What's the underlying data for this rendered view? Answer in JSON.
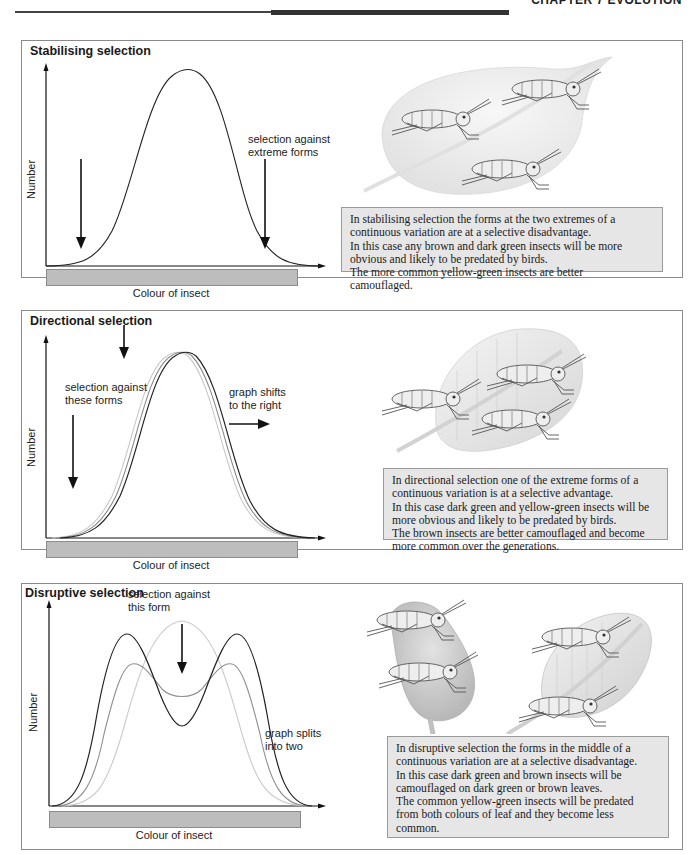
{
  "header": {
    "chapter_label": "CHAPTER 7  EVOLUTION"
  },
  "panels": [
    {
      "title": "Stabilising selection",
      "y_axis_label": "Number",
      "x_axis_label": "Colour of insect",
      "annotations": [
        "selection against",
        "extreme forms"
      ],
      "caption": [
        "In stabilising selection the forms at the two extremes of a",
        "continuous variation are at a selective disadvantage.",
        "In this case any brown and dark green insects will be more",
        "obvious and likely to be predated by birds.",
        "The more common yellow-green insects are better",
        "camouflaged."
      ]
    },
    {
      "title": "Directional selection",
      "y_axis_label": "Number",
      "x_axis_label": "Colour of insect",
      "annotations": [
        "selection against",
        "these forms"
      ],
      "annotations_right": [
        "graph shifts",
        "to the right"
      ],
      "caption": [
        "In directional selection one of the extreme forms of a",
        "continuous variation is at a selective advantage.",
        "In this case dark green and yellow-green insects will be",
        "more obvious and likely to be predated by birds.",
        "The brown insects are better camouflaged and become",
        "more common over the generations."
      ]
    },
    {
      "title": "Disruptive selection",
      "y_axis_label": "Number",
      "x_axis_label": "Colour of insect",
      "annotations": [
        "selection against",
        "this form"
      ],
      "annotations_right": [
        "graph splits",
        "into two"
      ],
      "caption": [
        "In disruptive selection the forms in the middle of a",
        "continuous variation are at a selective disadvantage.",
        "In this case dark green and brown insects will be",
        "camouflaged on dark green or brown leaves.",
        "The common yellow-green insects will be predated",
        "from both colours of leaf and they become less",
        "common."
      ]
    }
  ],
  "colors": {
    "panel_border": "#8a8a8a",
    "caption_bg": "#e6e6e6",
    "color_bar": "#bdbdbd",
    "curve_dark": "#222222",
    "curve_mid": "#8a8a8a",
    "curve_light": "#c8c8c8",
    "leaf_light": "#ececec",
    "leaf_dark": "#c9c9c9"
  }
}
